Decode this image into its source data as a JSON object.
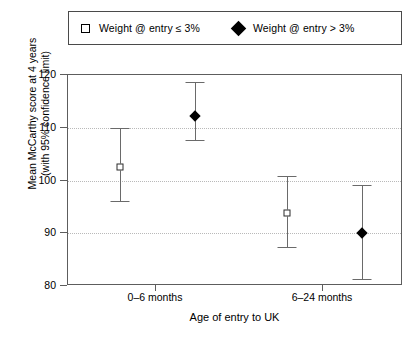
{
  "legend": {
    "entries": [
      {
        "marker": "open-square",
        "label": "Weight @ entry ≤ 3%"
      },
      {
        "marker": "filled-diamond",
        "label": "Weight @ entry > 3%"
      }
    ]
  },
  "chart_data": {
    "type": "scatter",
    "title": "",
    "xlabel": "Age of entry to UK",
    "ylabel": "Mean McCarthy score at 4 years\n(with 95% confidence limit)",
    "ylabel_line1": "Mean McCarthy score at 4 years",
    "ylabel_line2": "(with 95% confidence limit)",
    "categories": [
      "0–6 months",
      "6–24 months"
    ],
    "ylim": [
      80,
      120
    ],
    "yticks": [
      120,
      110,
      100,
      90,
      80
    ],
    "ytick_labels": [
      "120",
      "110",
      "100",
      "90",
      "80"
    ],
    "grid": "horizontal-dotted",
    "legend_position": "top",
    "error_bar_type": "95% confidence limit",
    "series": [
      {
        "name": "Weight @ entry ≤ 3%",
        "marker": "open-square",
        "points": [
          {
            "category": "0–6 months",
            "value": 102.5,
            "ci_low": 96.1,
            "ci_high": 109.9
          },
          {
            "category": "6–24 months",
            "value": 93.8,
            "ci_low": 87.3,
            "ci_high": 100.8
          }
        ]
      },
      {
        "name": "Weight @ entry > 3%",
        "marker": "filled-diamond",
        "points": [
          {
            "category": "0–6 months",
            "value": 112.3,
            "ci_low": 107.6,
            "ci_high": 118.6
          },
          {
            "category": "6–24 months",
            "value": 90.0,
            "ci_low": 81.3,
            "ci_high": 99.2
          }
        ]
      }
    ]
  }
}
